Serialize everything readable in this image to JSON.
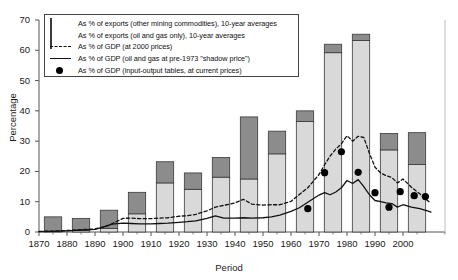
{
  "chart_data": {
    "type": "bar",
    "title": "",
    "xlabel": "Period",
    "ylabel": "Percentage",
    "ylim": [
      0,
      70
    ],
    "ytick_step": 10,
    "yticks": [
      0,
      10,
      20,
      30,
      40,
      50,
      60,
      70
    ],
    "categories": [
      "1870",
      "1880",
      "1890",
      "1900",
      "1910",
      "1920",
      "1930",
      "1940",
      "1950",
      "1960",
      "1970",
      "1980",
      "1990",
      "2000",
      "2010"
    ],
    "grid": false,
    "legend_position": "upper-left-inside",
    "legend": [
      "As % of exports (other mining commodities), 10-year averages",
      "As % of exports (oil and gas only), 10-year averages",
      "As % of GDP (at 2000 prices)",
      "As % of GDP (oil and gas at pre-1973 \"shadow price\")",
      "As % of GDP (input-output tables, at current prices)"
    ],
    "colors": {
      "other_mining": "#8c8c8c",
      "oil_and_gas": "#d9d9d9",
      "bar_edge": "#3a3a3a",
      "dashed_line": "#111111",
      "solid_line": "#111111",
      "dots": "#000000",
      "axis": "#555555"
    },
    "series": [
      {
        "name": "As % of exports (oil and gas only), 10-year averages",
        "type": "bar-segment",
        "stack": "exports",
        "values": [
          0.0,
          0.5,
          1.2,
          6.0,
          16.2,
          14.1,
          18.1,
          17.5,
          25.8,
          36.5,
          59.2,
          63.2,
          27.1,
          22.3,
          null
        ]
      },
      {
        "name": "As % of exports (other mining commodities), 10-year averages",
        "type": "bar-segment",
        "stack": "exports",
        "values": [
          5.0,
          4.0,
          6.0,
          7.1,
          7.0,
          5.4,
          6.5,
          20.5,
          7.5,
          3.5,
          2.8,
          2.1,
          5.4,
          10.5,
          null
        ]
      },
      {
        "name": "Stacked bar totals (exports, %)",
        "type": "bar-total",
        "values": [
          5.0,
          4.5,
          7.2,
          13.1,
          23.2,
          19.5,
          24.6,
          38.0,
          33.3,
          40.0,
          62.0,
          65.3,
          32.5,
          32.8,
          null
        ]
      },
      {
        "name": "As % of GDP (at 2000 prices)",
        "type": "line",
        "style": "dashed",
        "x": [
          1870,
          1875,
          1880,
          1885,
          1890,
          1895,
          1898,
          1900,
          1903,
          1906,
          1910,
          1913,
          1916,
          1920,
          1923,
          1926,
          1930,
          1933,
          1936,
          1940,
          1943,
          1946,
          1950,
          1953,
          1956,
          1960,
          1963,
          1966,
          1970,
          1972,
          1974,
          1976,
          1978,
          1980,
          1982,
          1984,
          1986,
          1988,
          1990,
          1992,
          1994,
          1996,
          1998,
          2000,
          2003,
          2006,
          2009,
          2010
        ],
        "y": [
          0.2,
          0.3,
          0.5,
          0.8,
          1.0,
          2.2,
          3.6,
          4.5,
          4.6,
          4.4,
          4.4,
          4.6,
          4.7,
          5.2,
          5.4,
          5.8,
          7.0,
          8.2,
          8.8,
          9.6,
          10.8,
          9.2,
          8.9,
          9.0,
          9.0,
          10.1,
          12.4,
          14.6,
          19.0,
          22.2,
          25.1,
          27.4,
          29.1,
          31.8,
          30.0,
          31.6,
          31.2,
          26.0,
          21.4,
          19.5,
          18.6,
          18.0,
          16.2,
          17.5,
          14.8,
          12.6,
          10.2,
          9.6
        ]
      },
      {
        "name": "As % of GDP (oil and gas at pre-1973 \"shadow price\")",
        "type": "line",
        "style": "solid",
        "x": [
          1870,
          1875,
          1880,
          1885,
          1890,
          1893,
          1896,
          1900,
          1903,
          1906,
          1910,
          1913,
          1916,
          1920,
          1923,
          1926,
          1930,
          1933,
          1936,
          1940,
          1943,
          1946,
          1950,
          1953,
          1956,
          1960,
          1963,
          1966,
          1970,
          1972,
          1974,
          1976,
          1978,
          1980,
          1982,
          1984,
          1986,
          1988,
          1990,
          1992,
          1994,
          1996,
          1998,
          2000,
          2003,
          2006,
          2009,
          2010
        ],
        "y": [
          0.1,
          0.2,
          0.4,
          0.6,
          0.9,
          1.6,
          2.6,
          2.9,
          2.8,
          2.7,
          2.7,
          2.8,
          2.9,
          3.2,
          3.4,
          3.7,
          4.5,
          5.3,
          4.6,
          4.6,
          4.7,
          4.6,
          4.7,
          5.0,
          5.6,
          6.8,
          8.0,
          9.8,
          12.2,
          13.0,
          12.3,
          13.2,
          14.6,
          17.0,
          16.0,
          17.3,
          15.0,
          12.3,
          10.4,
          10.0,
          9.6,
          9.4,
          8.2,
          9.0,
          8.2,
          7.7,
          6.9,
          6.6
        ]
      },
      {
        "name": "As % of GDP (input-output tables, at current prices)",
        "type": "scatter",
        "marker": "filled-circle",
        "x": [
          1966,
          1972,
          1978,
          1984,
          1990,
          1995,
          1999,
          2004,
          2008
        ],
        "y": [
          7.7,
          19.6,
          26.5,
          19.7,
          13.0,
          8.2,
          13.3,
          12.0,
          11.7
        ]
      }
    ]
  }
}
